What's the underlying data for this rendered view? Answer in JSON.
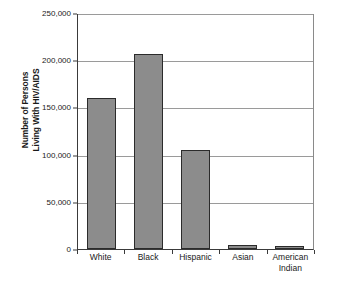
{
  "chart_data": {
    "type": "bar",
    "title": "",
    "subtitle": "",
    "xlabel": "",
    "ylabel": "Number of Persons\nLiving With HIV/AIDS",
    "ylabel_lines": [
      "Number of Persons",
      "Living With HIV/AIDS"
    ],
    "categories": [
      "White",
      "Black",
      "Hispanic",
      "Asian",
      "American\nIndian"
    ],
    "category_labels": [
      "White",
      "Black",
      "Hispanic",
      "Asian",
      "American Indian"
    ],
    "values": [
      159500,
      206800,
      104600,
      4500,
      3000
    ],
    "ylim": [
      0,
      250000
    ],
    "yticks": [
      0,
      50000,
      100000,
      150000,
      200000,
      250000
    ],
    "ytick_labels": [
      "0",
      "50,000",
      "100,000",
      "150,000",
      "200,000",
      "250,000"
    ],
    "grid": true,
    "grid_axis": "y",
    "legend": false,
    "legend_position": "none",
    "bar_color": "#8c8c8c",
    "bar_edge_color": "#2b2b2b",
    "gridline_color": "#9a9a9a",
    "axis_color": "#3a3a3a",
    "background_color": "#ffffff"
  }
}
